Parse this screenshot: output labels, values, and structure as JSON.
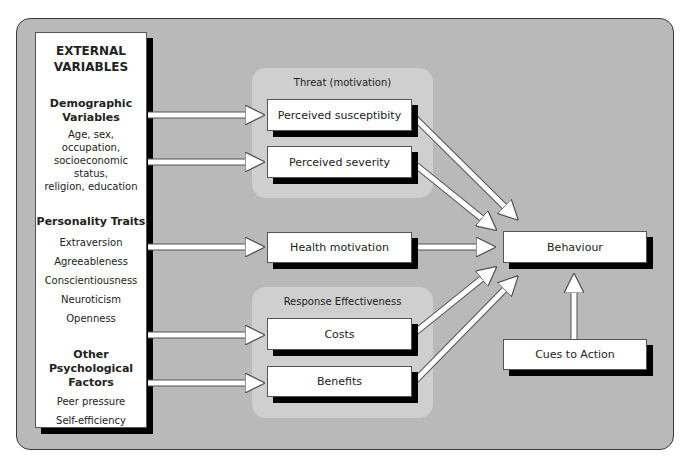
{
  "external": {
    "title_line1": "EXTERNAL",
    "title_line2": "VARIABLES",
    "groups": [
      {
        "heading_line1": "Demographic",
        "heading_line2": "Variables",
        "items": [
          "Age, sex,",
          "occupation,",
          "socioeconomic status,",
          "religion, education"
        ]
      },
      {
        "heading_line1": "Personality Traits",
        "heading_line2": "",
        "items": [
          "Extraversion",
          "Agreeableness",
          "Conscientiousness",
          "Neuroticism",
          "Openness"
        ]
      },
      {
        "heading_line1": "Other Psychological",
        "heading_line2": "Factors",
        "items": [
          "Peer pressure",
          "Self-efficiency"
        ]
      }
    ]
  },
  "threat_panel": {
    "title": "Threat (motivation)",
    "boxes": [
      "Perceived susceptibity",
      "Perceived severity"
    ]
  },
  "health_motivation": "Health motivation",
  "response_panel": {
    "title": "Response Effectiveness",
    "boxes": [
      "Costs",
      "Benefits"
    ]
  },
  "behaviour": "Behaviour",
  "cues_to_action": "Cues to Action",
  "colors": {
    "background": "#b9b9b9",
    "panel": "#cfcfcf",
    "box": "#ffffff",
    "shadow": "#000000"
  }
}
